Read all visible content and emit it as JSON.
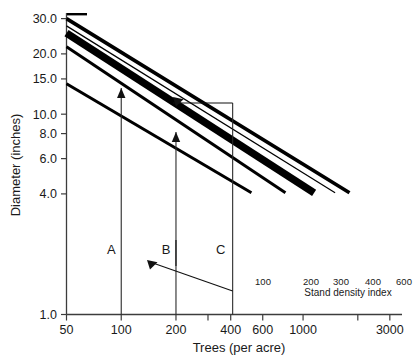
{
  "chart_data": {
    "type": "line",
    "title": "",
    "xlabel": "Trees (per acre)",
    "ylabel": "Diameter (inches)",
    "xscale": "log",
    "yscale": "log",
    "xlim": [
      50,
      3500
    ],
    "ylim": [
      1.0,
      32.0
    ],
    "grid": false,
    "legend_position": "inline-right",
    "legend_caption": "Stand density index",
    "x_ticks": [
      {
        "value": 50,
        "label": "50"
      },
      {
        "value": 100,
        "label": "100"
      },
      {
        "value": 200,
        "label": "200"
      },
      {
        "value": 300,
        "label": ""
      },
      {
        "value": 400,
        "label": "400"
      },
      {
        "value": 600,
        "label": "600"
      },
      {
        "value": 1000,
        "label": "1000"
      },
      {
        "value": 2000,
        "label": ""
      },
      {
        "value": 3000,
        "label": "3000"
      }
    ],
    "y_ticks": [
      {
        "value": 30.0,
        "label": "30.0"
      },
      {
        "value": 20.0,
        "label": "20.0"
      },
      {
        "value": 15.0,
        "label": "15.0"
      },
      {
        "value": 10.0,
        "label": "10.0"
      },
      {
        "value": 8.0,
        "label": "8.0"
      },
      {
        "value": 6.0,
        "label": "6.0"
      },
      {
        "value": 4.0,
        "label": "4.0"
      },
      {
        "value": 1.0,
        "label": "1.0"
      }
    ],
    "series": [
      {
        "name": "600",
        "sdi": 600,
        "label": "600",
        "thickness": 3.6,
        "points": [
          [
            50,
            30.0
          ],
          [
            1800,
            4.05
          ]
        ]
      },
      {
        "name": "400",
        "sdi": 400,
        "label": "400",
        "thickness": 1.2,
        "points": [
          [
            50,
            27.6
          ],
          [
            1500,
            4.05
          ]
        ]
      },
      {
        "name": "300",
        "sdi": 300,
        "label": "300",
        "thickness": 7.5,
        "points": [
          [
            50,
            25.4
          ],
          [
            1150,
            4.05
          ]
        ]
      },
      {
        "name": "200",
        "sdi": 200,
        "label": "200",
        "thickness": 3.0,
        "points": [
          [
            50,
            21.7
          ],
          [
            800,
            4.05
          ]
        ]
      },
      {
        "name": "100",
        "sdi": 100,
        "label": "100",
        "thickness": 3.0,
        "points": [
          [
            50,
            14.2
          ],
          [
            520,
            4.05
          ]
        ]
      }
    ],
    "reference_lines": [
      {
        "name": "A",
        "label": "A",
        "x": 100,
        "label_y": 4.35
      },
      {
        "name": "B",
        "label": "B",
        "x": 200,
        "label_y": 4.35
      },
      {
        "name": "C",
        "label": "C",
        "x": 410,
        "label_y": 4.35
      }
    ],
    "annotations": [
      {
        "name": "arrow-a-up",
        "from": [
          100,
          1.0
        ],
        "to": [
          100,
          16.6
        ],
        "head": "up"
      },
      {
        "name": "arrow-b-up",
        "from": [
          200,
          3.5
        ],
        "to": [
          200,
          11.6
        ],
        "head": "up"
      },
      {
        "name": "arrow-c-to-upper",
        "from": [
          410,
          14.9
        ],
        "to": [
          258,
          14.9
        ],
        "head": "left"
      },
      {
        "name": "arrow-c-to-lower",
        "from": [
          410,
          2.0
        ],
        "to": [
          215,
          3.45
        ],
        "head": "upleft"
      }
    ]
  },
  "axis": {
    "x_title": "Trees (per acre)",
    "y_title": "Diameter (inches)"
  }
}
